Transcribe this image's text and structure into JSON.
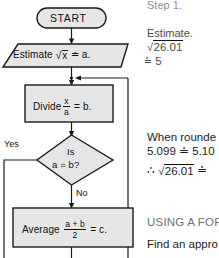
{
  "document": {
    "kind": "math-textbook-flowchart",
    "topic": "Square root approximation by divide-and-average"
  },
  "flowchart": {
    "nodes": [
      {
        "id": "start",
        "shape": "terminator-oval",
        "label": "START"
      },
      {
        "id": "estimate",
        "shape": "parallelogram-input",
        "prefix": "Estimate",
        "radical_sign": "√",
        "radicand": "x",
        "approx_symbol": "≐",
        "result": "a.",
        "plain": "Estimate √x ≐ a."
      },
      {
        "id": "divide",
        "shape": "process-rectangle",
        "prefix": "Divide",
        "numerator": "x",
        "denominator": "a",
        "equals": "=",
        "result": "b.",
        "plain": "Divide x/a = b."
      },
      {
        "id": "decision",
        "shape": "decision-diamond",
        "line1": "Is",
        "line2_left": "a",
        "line2_equals": "=",
        "line2_right": "b?",
        "plain": "Is a = b?"
      },
      {
        "id": "average",
        "shape": "process-rectangle",
        "prefix": "Average",
        "numerator": "a + b",
        "denominator": "2",
        "equals": "=",
        "result": "c.",
        "plain": "Average (a + b)/2 = c."
      }
    ],
    "branch_labels": {
      "yes": "Yes",
      "no": "No"
    },
    "colors": {
      "node_fill": "#e6e6e6",
      "node_stroke": "#1a1a1a",
      "connector": "#1a1a1a",
      "page_background": "#ffffff"
    }
  },
  "worked_example": {
    "step_heading": "Step 1.",
    "step_action": "Estimate.",
    "expr_radical_sign": "√",
    "expr_radicand": "26.01",
    "expr_approx": "≐ 5",
    "rounding_note": "When rounde",
    "rounding_line": "5.099 ≐ 5.10",
    "conclusion_therefore": "∴",
    "conclusion_radical_sign": "√",
    "conclusion_radicand": "26.01",
    "conclusion_approx": "≐",
    "section_heading": "USING A FOR",
    "section_body": "Find an appro"
  }
}
